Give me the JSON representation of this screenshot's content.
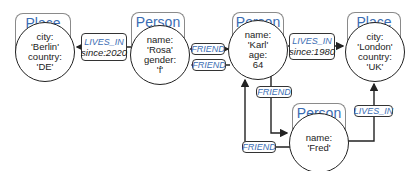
{
  "nodes": {
    "berlin": {
      "type": "Place",
      "props": [
        "city:",
        "'Berlin'",
        "country:",
        "'DE'"
      ]
    },
    "rosa": {
      "type": "Person",
      "props": [
        "name:",
        "'Rosa'",
        "gender:",
        "'f'"
      ]
    },
    "karl": {
      "type": "Person",
      "props": [
        "name:",
        "'Karl'",
        "age:",
        "64"
      ]
    },
    "london": {
      "type": "Place",
      "props": [
        "city:",
        "'London'",
        "country:",
        "'UK'"
      ]
    },
    "fred": {
      "type": "Person",
      "props": [
        "name:",
        "'Fred'"
      ]
    }
  },
  "edges": {
    "rosa_lives_in": {
      "label": "LIVES_IN",
      "prop": "since:2020"
    },
    "rosa_friend_karl": {
      "label": "FRIEND"
    },
    "karl_friend_rosa": {
      "label": "FRIEND"
    },
    "karl_lives_in": {
      "label": "LIVES_IN",
      "prop": "since:1980"
    },
    "karl_friend_fred": {
      "label": "FRIEND"
    },
    "fred_friend_karl": {
      "label": "FRIEND"
    },
    "fred_lives_in": {
      "label": "LIVES_IN"
    }
  },
  "colors": {
    "type_label": "#3a6cb3",
    "edge": "#222222",
    "tab_border": "#8a8a8a"
  }
}
